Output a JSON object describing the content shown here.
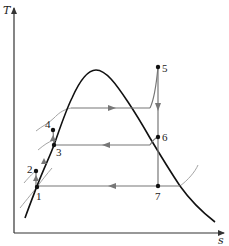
{
  "diagram": {
    "type": "T-s diagram (regenerative vapor power cycle)",
    "axes": {
      "y_label": "T",
      "x_label": "s"
    },
    "colors": {
      "dome": "#111111",
      "process_lines": "#777777",
      "axes": "#333333",
      "points": "#111111"
    },
    "points": [
      {
        "id": "1",
        "label": "1"
      },
      {
        "id": "2",
        "label": "2"
      },
      {
        "id": "3",
        "label": "3"
      },
      {
        "id": "4",
        "label": "4"
      },
      {
        "id": "5",
        "label": "5"
      },
      {
        "id": "6",
        "label": "6"
      },
      {
        "id": "7",
        "label": "7"
      }
    ],
    "processes": [
      {
        "name": "boiler-heating",
        "direction": "right"
      },
      {
        "name": "superheat",
        "direction": "up"
      },
      {
        "name": "turbine-expansion-5-6",
        "direction": "down"
      },
      {
        "name": "turbine-expansion-6-7",
        "direction": "down"
      },
      {
        "name": "extraction-heat-rejection-6-3",
        "direction": "left"
      },
      {
        "name": "condensation-7-1",
        "direction": "left"
      },
      {
        "name": "pump-1-2",
        "direction": "up"
      },
      {
        "name": "pump-3-4",
        "direction": "up"
      }
    ]
  }
}
